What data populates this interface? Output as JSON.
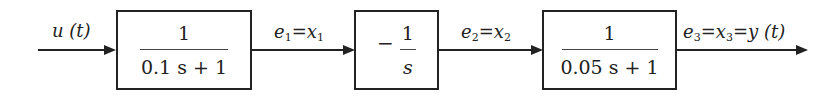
{
  "diagram": {
    "type": "block-diagram",
    "signals": {
      "input": "u (t)",
      "s1": {
        "e": "e",
        "e_sub": "1",
        "eq": "=",
        "x": "x",
        "x_sub": "1"
      },
      "s2": {
        "e": "e",
        "e_sub": "2",
        "eq": "=",
        "x": "x",
        "x_sub": "2"
      },
      "s3": {
        "e": "e",
        "e_sub": "3",
        "eq1": "=",
        "x": "x",
        "x_sub": "3",
        "eq2": "=",
        "y": "y (t)"
      }
    },
    "blocks": [
      {
        "numerator": "1",
        "denominator": "0.1 s + 1"
      },
      {
        "sign": "−",
        "numerator": "1",
        "denominator": "s"
      },
      {
        "numerator": "1",
        "denominator": "0.05 s + 1"
      }
    ]
  }
}
